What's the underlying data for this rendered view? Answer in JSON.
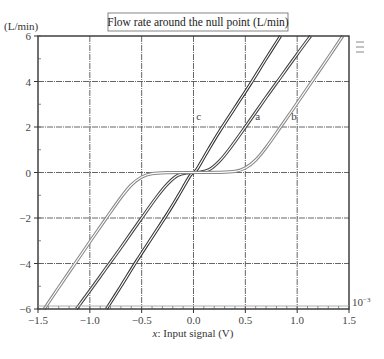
{
  "chart_data": {
    "type": "line",
    "title": "Flow rate around the null point (L/min)",
    "xlabel_var": "x",
    "xlabel": ": Input signal (V)",
    "ylabel": "(L/min)",
    "xlim": [
      -1.5,
      1.5
    ],
    "ylim": [
      -6,
      6
    ],
    "x_ticks": [
      -1.5,
      -1.0,
      -0.5,
      0.0,
      0.5,
      1.0,
      1.5
    ],
    "x_tick_labels": [
      "−1.5",
      "−1.0",
      "−0.5",
      "0.0",
      "0.5",
      "1.0",
      "1.5"
    ],
    "y_ticks": [
      -6,
      -4,
      -2,
      0,
      2,
      4,
      6
    ],
    "y_tick_labels": [
      "−6",
      "−4",
      "−2",
      "0",
      "2",
      "4",
      "6"
    ],
    "grid": true,
    "scale_note": "10−3",
    "series": [
      {
        "name": "c",
        "color": "#333333",
        "x": [
          -0.84,
          -0.7,
          -0.55,
          -0.4,
          -0.25,
          -0.15,
          -0.08,
          -0.03,
          0,
          0.03,
          0.08,
          0.15,
          0.25,
          0.4,
          0.55,
          0.7,
          0.84
        ],
        "y": [
          -6,
          -5.0,
          -3.9,
          -2.85,
          -1.8,
          -1.05,
          -0.5,
          -0.12,
          0,
          0.12,
          0.5,
          1.05,
          1.8,
          2.85,
          3.9,
          5.0,
          6
        ]
      },
      {
        "name": "a",
        "color": "#444444",
        "x": [
          -1.13,
          -1.0,
          -0.85,
          -0.7,
          -0.5,
          -0.35,
          -0.25,
          -0.15,
          -0.05,
          0,
          0.05,
          0.15,
          0.25,
          0.35,
          0.5,
          0.7,
          0.85,
          1.0,
          1.13
        ],
        "y": [
          -6,
          -5.2,
          -4.25,
          -3.3,
          -2.0,
          -1.05,
          -0.5,
          -0.12,
          -0.01,
          0,
          0.01,
          0.12,
          0.5,
          1.05,
          2.0,
          3.3,
          4.25,
          5.2,
          6
        ]
      },
      {
        "name": "b",
        "color": "#888888",
        "x": [
          -1.44,
          -1.3,
          -1.15,
          -1.0,
          -0.84,
          -0.7,
          -0.6,
          -0.5,
          -0.4,
          -0.25,
          0,
          0.25,
          0.4,
          0.5,
          0.6,
          0.7,
          0.84,
          1.0,
          1.15,
          1.3,
          1.44
        ],
        "y": [
          -6,
          -5.05,
          -4.05,
          -3.05,
          -2.0,
          -1.1,
          -0.55,
          -0.2,
          -0.05,
          -0.005,
          0,
          0.005,
          0.05,
          0.2,
          0.55,
          1.1,
          2.0,
          3.05,
          4.05,
          5.05,
          6
        ]
      }
    ],
    "annotations": [
      {
        "text": "c",
        "x": 0.05,
        "y": 2.3
      },
      {
        "text": "a",
        "x": 0.62,
        "y": 2.3
      },
      {
        "text": "b",
        "x": 0.97,
        "y": 2.3
      }
    ]
  }
}
